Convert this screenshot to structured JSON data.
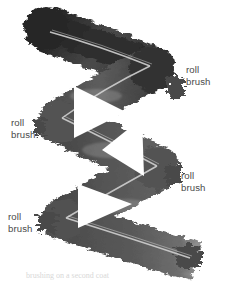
{
  "figure": {
    "background_color": "#ffffff",
    "width": 235,
    "height": 282,
    "medium": "photograph of painted brushstroke",
    "stroke": {
      "shape": "zigzag",
      "color_dark": "#2b2b2b",
      "color_mid": "#555555",
      "color_light": "#8c8c8c",
      "seam_color": "#c9c9c9",
      "segments": 4,
      "edge": "ragged"
    }
  },
  "annotations": [
    {
      "id": "top-right",
      "line1": "roll",
      "line2": "brush"
    },
    {
      "id": "mid-left",
      "line1": "roll",
      "line2": "brush"
    },
    {
      "id": "lower-right",
      "line1": "roll",
      "line2": "brush"
    },
    {
      "id": "bottom-left",
      "line1": "roll",
      "line2": "brush"
    }
  ],
  "caption": {
    "text": "brushing on a second coat"
  }
}
